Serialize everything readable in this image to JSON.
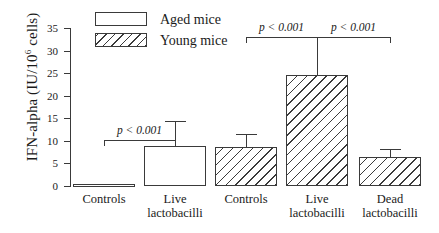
{
  "chart_data": {
    "type": "bar",
    "title": "",
    "xlabel": "",
    "ylabel": "IFN-alpha (IU/10",
    "ylabel_sup": "6",
    "ylabel_tail": " cells)",
    "ylim": [
      0,
      35
    ],
    "yticks": [
      0,
      5,
      10,
      15,
      20,
      25,
      30,
      35
    ],
    "ytick_labels": [
      "0",
      "5",
      "10",
      "15",
      "20",
      "25",
      "30",
      "35"
    ],
    "grid": false,
    "legend_position": "top-center",
    "legend": [
      {
        "label": "Aged mice",
        "fill": "white"
      },
      {
        "label": "Young mice",
        "fill": "hatched"
      }
    ],
    "categories": [
      "Controls",
      "Live lactobacilli",
      "Controls",
      "Live lactobacilli",
      "Dead lactobacilli"
    ],
    "category_lines": [
      [
        "Controls"
      ],
      [
        "Live",
        "lactobacilli"
      ],
      [
        "Controls"
      ],
      [
        "Live",
        "lactobacilli"
      ],
      [
        "Dead",
        "lactobacilli"
      ]
    ],
    "groups": [
      "Aged mice",
      "Aged mice",
      "Young mice",
      "Young mice",
      "Young mice"
    ],
    "values": [
      0.5,
      8.8,
      8.7,
      24.5,
      6.5
    ],
    "errors_upper": [
      0,
      5.7,
      2.8,
      8.5,
      1.7
    ],
    "error_tops": [
      0.5,
      14.5,
      11.5,
      33.0,
      8.2
    ],
    "annotations": [
      {
        "text": "p < 0.001",
        "from_bar": 0,
        "to_bar": 1,
        "level": 14.5
      },
      {
        "text": "p < 0.001",
        "from_bar": 2,
        "to_bar": 3,
        "level": 35.0
      },
      {
        "text": "p < 0.001",
        "from_bar": 3,
        "to_bar": 4,
        "level": 35.0
      }
    ],
    "colors": {
      "axis": "#3a3a3a",
      "bar_edge": "#3a3a3a",
      "bar_fill_aged": "#ffffff",
      "bar_fill_young": "hatched"
    }
  }
}
